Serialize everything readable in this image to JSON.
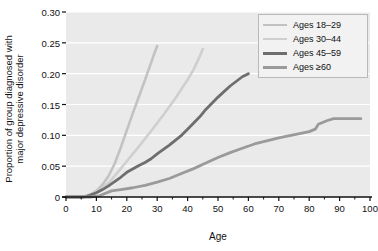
{
  "chart_data": {
    "type": "line",
    "title": "",
    "xlabel": "Age",
    "ylabel": "Proportion of group diagnosed with\nmajor depressive disorder",
    "xlim": [
      0,
      100
    ],
    "ylim": [
      0,
      0.3
    ],
    "xticks": [
      "0",
      "10",
      "20",
      "30",
      "40",
      "50",
      "60",
      "70",
      "80",
      "90",
      "100"
    ],
    "xtick_values": [
      0,
      10,
      20,
      30,
      40,
      50,
      60,
      70,
      80,
      90,
      100
    ],
    "yticks": [
      "0",
      "0.05",
      "0.10",
      "0.15",
      "0.20",
      "0.25",
      "0.30"
    ],
    "ytick_values": [
      0,
      0.05,
      0.1,
      0.15,
      0.2,
      0.25,
      0.3
    ],
    "grid": "horizontal",
    "legend_position": "top-right",
    "panel_color": "#eaeaea",
    "grid_color": "#ffffff",
    "series": [
      {
        "name": "Ages 18–29",
        "color": "#c2c2c2",
        "width": 2.6,
        "points": [
          [
            0,
            0.0
          ],
          [
            5,
            0.0
          ],
          [
            6,
            0.001
          ],
          [
            8,
            0.004
          ],
          [
            10,
            0.01
          ],
          [
            12,
            0.02
          ],
          [
            14,
            0.034
          ],
          [
            16,
            0.054
          ],
          [
            18,
            0.08
          ],
          [
            20,
            0.108
          ],
          [
            22,
            0.136
          ],
          [
            24,
            0.163
          ],
          [
            26,
            0.19
          ],
          [
            28,
            0.218
          ],
          [
            29,
            0.232
          ],
          [
            30,
            0.245
          ]
        ]
      },
      {
        "name": "Ages 30–44",
        "color": "#cfcfcf",
        "width": 2.6,
        "points": [
          [
            0,
            0.0
          ],
          [
            6,
            0.0
          ],
          [
            8,
            0.003
          ],
          [
            10,
            0.008
          ],
          [
            12,
            0.015
          ],
          [
            14,
            0.023
          ],
          [
            16,
            0.034
          ],
          [
            18,
            0.046
          ],
          [
            20,
            0.058
          ],
          [
            24,
            0.082
          ],
          [
            28,
            0.107
          ],
          [
            32,
            0.133
          ],
          [
            36,
            0.16
          ],
          [
            40,
            0.19
          ],
          [
            42,
            0.207
          ],
          [
            44,
            0.228
          ],
          [
            45,
            0.24
          ]
        ]
      },
      {
        "name": "Ages 45–59",
        "color": "#6e6e6e",
        "width": 2.8,
        "points": [
          [
            0,
            0.0
          ],
          [
            6,
            0.0
          ],
          [
            8,
            0.003
          ],
          [
            10,
            0.007
          ],
          [
            12,
            0.012
          ],
          [
            14,
            0.018
          ],
          [
            16,
            0.025
          ],
          [
            18,
            0.032
          ],
          [
            20,
            0.04
          ],
          [
            24,
            0.051
          ],
          [
            26,
            0.056
          ],
          [
            28,
            0.062
          ],
          [
            30,
            0.07
          ],
          [
            34,
            0.084
          ],
          [
            38,
            0.1
          ],
          [
            40,
            0.11
          ],
          [
            44,
            0.13
          ],
          [
            46,
            0.142
          ],
          [
            50,
            0.162
          ],
          [
            54,
            0.18
          ],
          [
            58,
            0.195
          ],
          [
            60,
            0.2
          ]
        ]
      },
      {
        "name": "Ages ≥60",
        "color": "#9a9a9a",
        "width": 2.8,
        "points": [
          [
            0,
            0.0
          ],
          [
            8,
            0.0
          ],
          [
            11,
            0.002
          ],
          [
            13,
            0.006
          ],
          [
            15,
            0.01
          ],
          [
            18,
            0.012
          ],
          [
            22,
            0.015
          ],
          [
            26,
            0.019
          ],
          [
            30,
            0.024
          ],
          [
            34,
            0.03
          ],
          [
            38,
            0.038
          ],
          [
            42,
            0.046
          ],
          [
            46,
            0.055
          ],
          [
            50,
            0.064
          ],
          [
            54,
            0.072
          ],
          [
            58,
            0.079
          ],
          [
            62,
            0.086
          ],
          [
            66,
            0.091
          ],
          [
            70,
            0.096
          ],
          [
            74,
            0.1
          ],
          [
            78,
            0.104
          ],
          [
            80,
            0.106
          ],
          [
            82,
            0.11
          ],
          [
            83,
            0.118
          ],
          [
            84,
            0.12
          ],
          [
            86,
            0.124
          ],
          [
            88,
            0.127
          ],
          [
            92,
            0.127
          ],
          [
            97,
            0.127
          ]
        ]
      }
    ]
  },
  "legend": {
    "items": [
      {
        "label": "Ages 18–29",
        "color": "#c2c2c2",
        "width": 2.6
      },
      {
        "label": "Ages 30–44",
        "color": "#cfcfcf",
        "width": 2.6
      },
      {
        "label": "Ages 45–59",
        "color": "#6e6e6e",
        "width": 3.0
      },
      {
        "label": "Ages ≥60",
        "color": "#9a9a9a",
        "width": 3.0
      }
    ]
  }
}
